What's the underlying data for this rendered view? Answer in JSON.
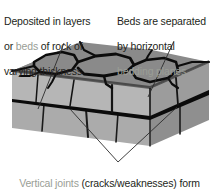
{
  "figure": {
    "background_color": "#ffffff",
    "annotations": {
      "top_left": {
        "name": "beds-annotation",
        "line1_plain": "Deposited in layers",
        "line2_prefix": "or ",
        "line2_highlight": "beds",
        "line2_suffix": " of rock of",
        "line3_plain": "varying thickness"
      },
      "top_right": {
        "name": "bedding-planes-annotation",
        "line1_plain": "Beds are separated",
        "line2_plain": "by horizontal",
        "line3_highlight": "bedding planes"
      },
      "bottom": {
        "name": "vertical-joints-annotation",
        "line1_highlight": "Vertical joints",
        "line1_plain": " (cracks/weaknesses) form",
        "line2_plain": "in some rocks as they dry out and harden"
      }
    },
    "colors": {
      "text_dark": "#231f20",
      "text_highlight": "#9a9e96",
      "block_top_face": "#8c8c8c",
      "block_front_face": "#b3b3b3",
      "block_side_face": "#9e9e9e",
      "block_lower_front": "#adadad",
      "block_lower_side": "#999999",
      "joint_line": "#111111",
      "bedding_plane": "#0d0d0d",
      "leader_line": "#2b2b2b"
    },
    "block_diagram": {
      "type": "isometric-rock-block",
      "faces": [
        "top-surface-with-joints",
        "upper-bed-front-face",
        "upper-bed-side-face",
        "lower-bed-front-face",
        "lower-bed-side-face"
      ],
      "feature_counts": {
        "vertical_joints_on_top": 7,
        "bedding_planes": 2,
        "beds": 2
      }
    },
    "leader_lines": [
      {
        "name": "leader-beds",
        "from": [
          62,
          44
        ],
        "to": [
          38,
          108
        ]
      },
      {
        "name": "leader-bedding-planes",
        "from": [
          172,
          42
        ],
        "to": [
          148,
          96
        ]
      },
      {
        "name": "leader-joints-left",
        "from": [
          118,
          162
        ],
        "to": [
          70,
          110
        ]
      },
      {
        "name": "leader-joints-right",
        "from": [
          118,
          162
        ],
        "to": [
          176,
          108
        ]
      }
    ]
  }
}
